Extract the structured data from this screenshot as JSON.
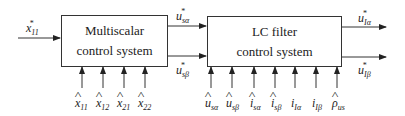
{
  "blocks": {
    "multiscalar": {
      "line1": "Multiscalar",
      "line2": "control system"
    },
    "lc_filter": {
      "line1": "LC filter",
      "line2": "control system"
    }
  },
  "signals": {
    "input": {
      "base": "x",
      "sub": "11",
      "sup": "*"
    },
    "mid_alpha": {
      "base": "u",
      "sub": "sα",
      "sup": "*"
    },
    "mid_beta": {
      "base": "u",
      "sub": "sβ",
      "sup": "*"
    },
    "out_alpha": {
      "base": "u",
      "sub": "Iα",
      "sup": "*"
    },
    "out_beta": {
      "base": "u",
      "sub": "Iβ",
      "sup": "*"
    }
  },
  "block1_inputs": [
    {
      "base": "x",
      "sub": "11",
      "hat": true
    },
    {
      "base": "x",
      "sub": "12",
      "hat": true
    },
    {
      "base": "x",
      "sub": "21",
      "hat": true
    },
    {
      "base": "x",
      "sub": "22",
      "hat": true
    }
  ],
  "block2_inputs": [
    {
      "base": "u",
      "sub": "sα",
      "hat": true
    },
    {
      "base": "u",
      "sub": "sβ",
      "hat": true
    },
    {
      "base": "i",
      "sub": "sα",
      "hat": true
    },
    {
      "base": "i",
      "sub": "sβ",
      "hat": true
    },
    {
      "base": "i",
      "sub": "Iα",
      "hat": false
    },
    {
      "base": "i",
      "sub": "Iβ",
      "hat": false
    },
    {
      "base": "ρ",
      "sub": "us",
      "hat": true
    }
  ]
}
